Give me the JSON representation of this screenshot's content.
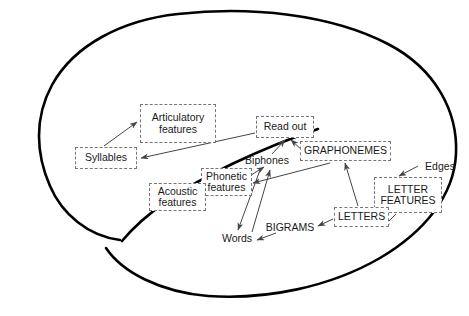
{
  "figure": {
    "type": "diagram",
    "outline_name": "brain-outline",
    "colors": {
      "outline": "#000000",
      "box_border": "#777777",
      "text": "#1a1a1a",
      "arrow": "#444444",
      "background": "#ffffff"
    }
  },
  "nodes": {
    "articulatory_features": {
      "label": "Articulatory\nfeatures",
      "boxed": true
    },
    "syllables": {
      "label": "Syllables",
      "boxed": true
    },
    "read_out": {
      "label": "Read out",
      "boxed": true
    },
    "graphonemes": {
      "label": "GRAPHONEMES",
      "boxed": true
    },
    "biphones": {
      "label": "Biphones",
      "boxed": false
    },
    "phonetic_features": {
      "label": "Phonetic\nfeatures",
      "boxed": true
    },
    "acoustic_features": {
      "label": "Acoustic\nfeatures",
      "boxed": true
    },
    "edges": {
      "label": "Edges",
      "boxed": false
    },
    "letter_features": {
      "label": "LETTER\nFEATURES",
      "boxed": true
    },
    "letters": {
      "label": "LETTERS",
      "boxed": true
    },
    "bigrams": {
      "label": "BIGRAMS",
      "boxed": false
    },
    "words": {
      "label": "Words",
      "boxed": false
    }
  },
  "edges_list": [
    {
      "from": "syllables",
      "to": "articulatory_features"
    },
    {
      "from": "read_out",
      "to": "syllables"
    },
    {
      "from": "biphones",
      "to": "read_out"
    },
    {
      "from": "graphonemes",
      "to": "read_out"
    },
    {
      "from": "acoustic_features",
      "to": "phonetic_features"
    },
    {
      "from": "phonetic_features",
      "to": "biphones"
    },
    {
      "from": "biphones",
      "to": "words"
    },
    {
      "from": "words",
      "to": "biphones"
    },
    {
      "from": "graphonemes",
      "to": "phonetic_features"
    },
    {
      "from": "letters",
      "to": "graphonemes"
    },
    {
      "from": "letter_features",
      "to": "letters"
    },
    {
      "from": "edges",
      "to": "letter_features"
    },
    {
      "from": "bigrams",
      "to": "words"
    },
    {
      "from": "letters",
      "to": "bigrams"
    }
  ]
}
